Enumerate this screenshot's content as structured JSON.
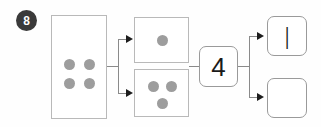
{
  "worksheet": {
    "question_number": "8",
    "type": "number-bond-decomposition"
  },
  "source_group": {
    "name": "four-counters-box",
    "dot_count": 4,
    "dots": [
      {
        "x": 16,
        "y": 47
      },
      {
        "x": 36,
        "y": 47
      },
      {
        "x": 16,
        "y": 66
      },
      {
        "x": 36,
        "y": 66
      }
    ]
  },
  "part_groups": [
    {
      "name": "one-counter-box",
      "dot_count": 1,
      "dots": [
        {
          "x": 25,
          "y": 20
        }
      ]
    },
    {
      "name": "three-counters-box",
      "dot_count": 3,
      "dots": [
        {
          "x": 16,
          "y": 13
        },
        {
          "x": 35,
          "y": 13
        },
        {
          "x": 25,
          "y": 31
        }
      ]
    }
  ],
  "numerals": {
    "whole": "4",
    "part_filled": "|",
    "part_blank": ""
  },
  "colors": {
    "badge_fill": "#3a3a3a",
    "badge_text": "#ffffff",
    "dot_fill": "#9d9d9d",
    "box_border": "#b9b9b9",
    "rounded_box_border": "#9a9a9a",
    "connector": "#8a8a8a",
    "arrow": "#1d1d1d",
    "numeral_text": "#1a1a1a",
    "page_background": "#fefefe"
  }
}
